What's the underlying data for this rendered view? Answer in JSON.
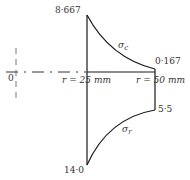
{
  "diagram": {
    "type": "stress-distribution",
    "origin_label": "0",
    "inner_radius_label": "r = 25 mm",
    "outer_radius_label": "r = 50 mm",
    "hoop": {
      "symbol": "σc",
      "symbol_main": "σ",
      "symbol_sub": "c",
      "inner_value": "8·667",
      "outer_value": "0·167"
    },
    "radial": {
      "symbol": "σr",
      "symbol_main": "σ",
      "symbol_sub": "r",
      "inner_value": "14·0",
      "outer_value": "5·5"
    },
    "colors": {
      "line": "#1a1a1a",
      "text": "#333333",
      "background": "#ffffff"
    }
  }
}
